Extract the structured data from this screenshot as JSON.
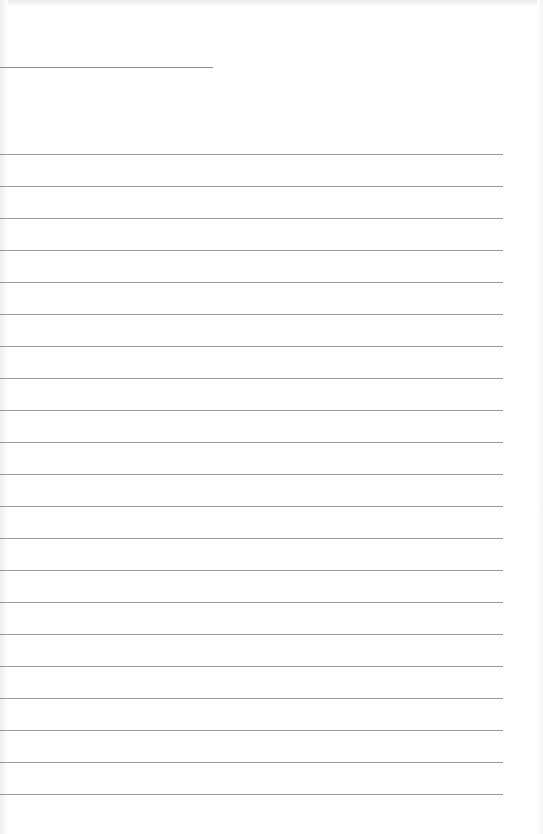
{
  "page": {
    "type": "blank lined sheet",
    "header_field_line": {
      "length_px": 213,
      "y": 67
    },
    "ruled_lines": {
      "count": 21,
      "first_y": 154,
      "spacing_px": 32,
      "width_px": 503
    },
    "colors": {
      "paper": "#ffffff",
      "line": "#9a9a9a",
      "field_line": "#8e8e8e"
    }
  }
}
